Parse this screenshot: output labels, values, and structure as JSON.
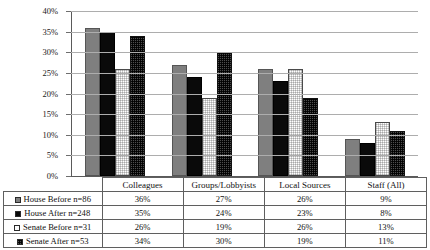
{
  "chart_data": {
    "type": "bar",
    "title": "",
    "xlabel": "",
    "ylabel": "",
    "ylim": [
      0,
      40
    ],
    "ytick_labels": [
      "40%",
      "35%",
      "30%",
      "25%",
      "20%",
      "15%",
      "10%",
      "5%",
      "0%"
    ],
    "ytick_values": [
      40,
      35,
      30,
      25,
      20,
      15,
      10,
      5,
      0
    ],
    "grid": true,
    "legend_position": "table-left-column",
    "categories": [
      "Colleagues",
      "Groups/Lobbyists",
      "Local Sources",
      "Staff (All)"
    ],
    "series": [
      {
        "name": "House Before n=86",
        "swatch": "s0",
        "color": "#7f7f7f",
        "values": [
          36,
          27,
          26,
          9
        ],
        "labels": [
          "36%",
          "27%",
          "26%",
          "9%"
        ]
      },
      {
        "name": "House After n=248",
        "swatch": "s1",
        "color": "#0a0a0a",
        "values": [
          35,
          24,
          23,
          8
        ],
        "labels": [
          "35%",
          "24%",
          "23%",
          "8%"
        ]
      },
      {
        "name": "Senate Before n=31",
        "swatch": "s2",
        "color": "#fbfbfb",
        "values": [
          26,
          19,
          26,
          13
        ],
        "labels": [
          "26%",
          "19%",
          "26%",
          "13%"
        ]
      },
      {
        "name": "Senate After n=53",
        "swatch": "s3",
        "color": "#222222",
        "values": [
          34,
          30,
          19,
          11
        ],
        "labels": [
          "34%",
          "30%",
          "19%",
          "11%"
        ]
      }
    ]
  }
}
